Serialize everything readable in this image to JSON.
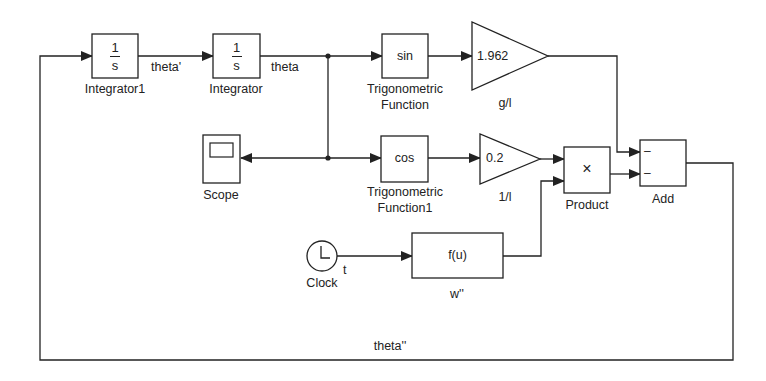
{
  "diagram": {
    "type": "simulink-block-diagram",
    "colors": {
      "line": "#222222",
      "background": "#ffffff"
    },
    "blocks": {
      "integrator1": {
        "numerator": "1",
        "denominator": "s",
        "label": "Integrator1"
      },
      "integrator": {
        "numerator": "1",
        "denominator": "s",
        "label": "Integrator"
      },
      "trig_sin": {
        "text": "sin",
        "label_line1": "Trigonometric",
        "label_line2": "Function"
      },
      "gain_g_over_l": {
        "text": "1.962",
        "label": "g/l"
      },
      "scope": {
        "label": "Scope",
        "icon": "scope-icon"
      },
      "trig_cos": {
        "text": "cos",
        "label_line1": "Trigonometric",
        "label_line2": "Function1"
      },
      "gain_1_over_l": {
        "text": "0.2",
        "label": "1/l"
      },
      "product": {
        "text": "×",
        "label": "Product"
      },
      "add": {
        "port1_sign": "–",
        "port2_sign": "–",
        "label": "Add"
      },
      "clock": {
        "label": "Clock",
        "icon": "clock-icon"
      },
      "fcn": {
        "text": "f(u)",
        "label": "w''"
      }
    },
    "signals": {
      "theta_prime": "theta'",
      "theta": "theta",
      "t": "t",
      "theta_double_prime": "theta''"
    }
  }
}
